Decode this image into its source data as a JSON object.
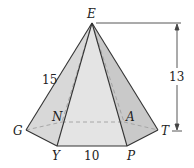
{
  "figure": {
    "type": "hexagonal pyramid",
    "vertices": {
      "apex": "E",
      "base": [
        "G",
        "Y",
        "P",
        "T",
        "A",
        "N"
      ]
    },
    "labels": {
      "E": "E",
      "G": "G",
      "Y": "Y",
      "P": "P",
      "T": "T",
      "A": "A",
      "N": "N"
    },
    "measurements": {
      "lateral_edge": "15",
      "base_edge": "10",
      "height": "13"
    },
    "colors": {
      "face_light": "#e6e6e6",
      "face_mid": "#d9d9d9",
      "face_dark": "#c8c8c8",
      "edge": "#333333",
      "hidden_edge": "#9a9a9a"
    }
  }
}
